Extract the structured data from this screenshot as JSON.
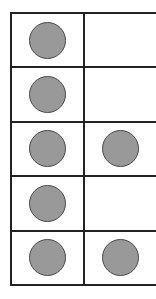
{
  "diagram": {
    "type": "ten-frame",
    "rows": 5,
    "columns": 2,
    "counter_color": "#999999",
    "outline_color": "#222222",
    "cells": [
      [
        true,
        false
      ],
      [
        true,
        false
      ],
      [
        true,
        true
      ],
      [
        true,
        false
      ],
      [
        true,
        true
      ]
    ],
    "total_counters": 7
  }
}
